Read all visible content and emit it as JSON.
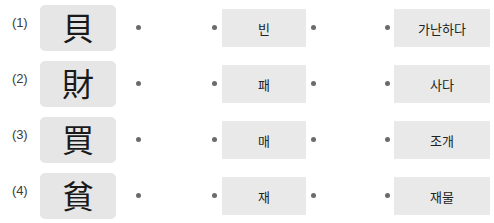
{
  "worksheet": {
    "type": "matching-exercise",
    "colors": {
      "page_background": "#ffffff",
      "hanja_chip_background": "#e6e6e6",
      "korean_chip_background": "#e9e9e9",
      "bullet": "#6a6a6a",
      "text": "#1a1a1a",
      "row_number_text": "#3b3b3b"
    },
    "rows": [
      {
        "number": "(1)",
        "hanja": "貝",
        "reading": "빈",
        "meaning": "가난하다"
      },
      {
        "number": "(2)",
        "hanja": "財",
        "reading": "패",
        "meaning": "사다"
      },
      {
        "number": "(3)",
        "hanja": "買",
        "reading": "매",
        "meaning": "조개"
      },
      {
        "number": "(4)",
        "hanja": "貧",
        "reading": "재",
        "meaning": "재물"
      }
    ]
  }
}
